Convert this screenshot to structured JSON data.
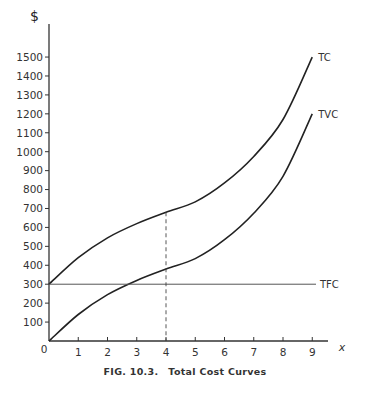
{
  "chart_data": {
    "type": "line",
    "title": "Total Cost Curves",
    "figure_label": "FIG. 10.3.",
    "xlabel": "x",
    "ylabel": "$",
    "xlim": [
      0,
      9
    ],
    "ylim": [
      0,
      1500
    ],
    "x_ticks": [
      0,
      1,
      2,
      3,
      4,
      5,
      6,
      7,
      8,
      9
    ],
    "y_ticks": [
      100,
      200,
      300,
      400,
      500,
      600,
      700,
      800,
      900,
      1000,
      1100,
      1200,
      1300,
      1400,
      1500
    ],
    "grid": false,
    "legend": "inline labels at curve ends",
    "x": [
      0,
      1,
      2,
      3,
      4,
      5,
      6,
      7,
      8,
      9
    ],
    "series": [
      {
        "name": "TC",
        "values": [
          300,
          440,
          545,
          620,
          680,
          735,
          835,
          975,
          1170,
          1500
        ]
      },
      {
        "name": "TVC",
        "values": [
          0,
          140,
          245,
          320,
          380,
          435,
          535,
          675,
          870,
          1200
        ]
      },
      {
        "name": "TFC",
        "values": [
          300,
          300,
          300,
          300,
          300,
          300,
          300,
          300,
          300,
          300
        ]
      }
    ],
    "annotations": [
      {
        "type": "dashed-vertical-line",
        "x": 4,
        "from_y": 0,
        "to_y": 680
      }
    ]
  },
  "caption": {
    "figure": "FIG. 10.3.",
    "title": "Total Cost Curves"
  },
  "axes": {
    "y_title": "$",
    "x_title": "x",
    "origin_label": "0"
  },
  "colors": {
    "curve": "#222222",
    "tfc_line": "#555555",
    "axis": "#333333",
    "background": "#ffffff"
  }
}
